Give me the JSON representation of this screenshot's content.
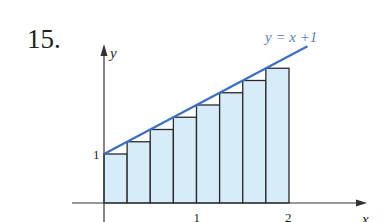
{
  "problem_number": "15.",
  "chart_data": {
    "type": "bar",
    "title": "",
    "function_label": "y = x +1",
    "function": "y = x + 1",
    "xlabel": "x",
    "ylabel": "y",
    "x_ticks": [
      "1",
      "2"
    ],
    "y_ticks": [
      "1"
    ],
    "xlim": [
      0,
      2
    ],
    "ylim": [
      0,
      3
    ],
    "grid": false,
    "rectangle_type": "left-endpoint",
    "num_rectangles": 8,
    "bar_width": 0.25,
    "categories": [
      "0",
      "0.25",
      "0.5",
      "0.75",
      "1",
      "1.25",
      "1.5",
      "1.75"
    ],
    "values": [
      1,
      1.25,
      1.5,
      1.75,
      2,
      2.25,
      2.5,
      2.75
    ],
    "line": {
      "x": [
        0,
        2.2
      ],
      "y": [
        1,
        3.2
      ]
    },
    "colors": {
      "line": "#3a6fc4",
      "bar_fill": "#d6ecf8",
      "bar_stroke": "#2a2a2a",
      "axis": "#333333",
      "label": "#231f20",
      "equation": "#5b7fb8"
    }
  }
}
